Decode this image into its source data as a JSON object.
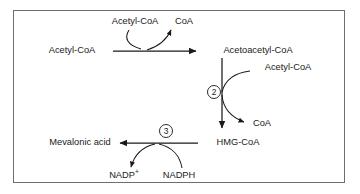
{
  "diagram": {
    "frame": {
      "border_color": "#6e6e6e",
      "background": "#ffffff"
    },
    "line_color": "#1a1a1a",
    "nodes": {
      "acetyl_coa_substrate": "Acetyl-CoA",
      "acetyl_coa_cofactor_top": "Acetyl-CoA",
      "coa_out_top": "CoA",
      "acetoacetyl_coa": "Acetoacetyl-CoA",
      "acetyl_coa_cofactor_mid": "Acetyl-CoA",
      "coa_out_mid": "CoA",
      "hmg_coa": "HMG-CoA",
      "mevalonic_acid": "Mevalonic acid",
      "nadp_plus": "NADP",
      "nadp_plus_charge": "+",
      "nadph": "NADPH"
    },
    "steps": [
      {
        "id": "step-2",
        "label": "2"
      },
      {
        "id": "step-3",
        "label": "3"
      }
    ]
  }
}
